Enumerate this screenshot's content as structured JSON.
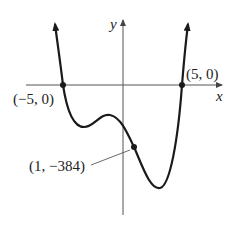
{
  "figure": {
    "axes": {
      "x_label": "x",
      "y_label": "y"
    },
    "points": [
      {
        "label": "(−5, 0)",
        "x": -5,
        "y": 0
      },
      {
        "label": "(5, 0)",
        "x": 5,
        "y": 0
      },
      {
        "label": "(1, −384)",
        "x": 1,
        "y": -384
      }
    ],
    "colors": {
      "curve": "#1a1a1a",
      "axis": "#555555",
      "background": "#ffffff"
    }
  }
}
